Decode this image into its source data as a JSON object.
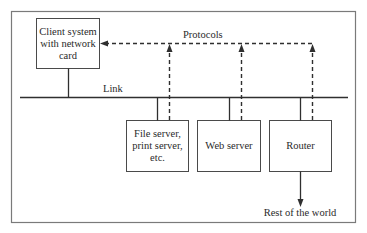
{
  "diagram": {
    "title": "",
    "nodes": {
      "client": {
        "line1": "Client system",
        "line2": "with network",
        "line3": "card"
      },
      "file_server": {
        "line1": "File server,",
        "line2": "print server,",
        "line3": "etc."
      },
      "web_server": {
        "label": "Web server"
      },
      "router": {
        "label": "Router"
      }
    },
    "edges": {
      "link_label": "Link",
      "protocols_label": "Protocols",
      "external_label": "Rest of the world"
    },
    "colors": {
      "stroke": "#2f2f2f",
      "frame": "#7a7a7a",
      "text": "#2a2a2a",
      "background": "#ffffff"
    }
  }
}
